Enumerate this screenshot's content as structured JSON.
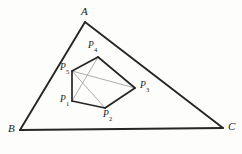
{
  "figure": {
    "width": 242,
    "height": 154,
    "background_color": "#fdfdfc",
    "outer_stroke_color": "#262626",
    "inner_stroke_color": "#262626",
    "diagonal_stroke_color": "#a6a6a6",
    "outer_stroke_width": 1.9,
    "inner_stroke_width": 1.7,
    "diagonal_stroke_width": 0.9
  },
  "triangle": {
    "name": "ABC",
    "vertices": [
      {
        "id": "A",
        "label": "A",
        "x": 85,
        "y": 22,
        "label_x": 81,
        "label_y": 6
      },
      {
        "id": "B",
        "label": "B",
        "x": 20,
        "y": 130,
        "label_x": 8,
        "label_y": 123
      },
      {
        "id": "C",
        "label": "C",
        "x": 223,
        "y": 128,
        "label_x": 228,
        "label_y": 121
      }
    ],
    "edges": [
      {
        "from": "A",
        "to": "B"
      },
      {
        "from": "B",
        "to": "C"
      },
      {
        "from": "C",
        "to": "A"
      }
    ]
  },
  "pentagon": {
    "name": "P1P2P3P4P5",
    "vertices": [
      {
        "id": "P1",
        "label": "P",
        "subscript": "1",
        "x": 72,
        "y": 101,
        "label_x": 60,
        "label_y": 95
      },
      {
        "id": "P2",
        "label": "P",
        "subscript": "2",
        "x": 105,
        "y": 108,
        "label_x": 103,
        "label_y": 110
      },
      {
        "id": "P3",
        "label": "P",
        "subscript": "3",
        "x": 135,
        "y": 88,
        "label_x": 140,
        "label_y": 81
      },
      {
        "id": "P4",
        "label": "P",
        "subscript": "4",
        "x": 98,
        "y": 57,
        "label_x": 88,
        "label_y": 41
      },
      {
        "id": "P5",
        "label": "P",
        "subscript": "5",
        "x": 72,
        "y": 71,
        "label_x": 60,
        "label_y": 63
      }
    ],
    "edges": [
      {
        "from": "P1",
        "to": "P2"
      },
      {
        "from": "P2",
        "to": "P3"
      },
      {
        "from": "P3",
        "to": "P4"
      },
      {
        "from": "P4",
        "to": "P5"
      },
      {
        "from": "P5",
        "to": "P1"
      }
    ],
    "diagonals": [
      {
        "from": "P5",
        "to": "P2"
      },
      {
        "from": "P5",
        "to": "P3"
      },
      {
        "from": "P4",
        "to": "P1"
      }
    ]
  }
}
